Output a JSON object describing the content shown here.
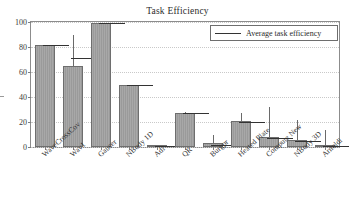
{
  "chart_data": {
    "type": "bar",
    "title": "Task Efficiency",
    "xlabel": "",
    "ylabel": "",
    "ylim": [
      0,
      100
    ],
    "yticks": [
      0,
      20,
      40,
      60,
      80,
      100
    ],
    "grid": true,
    "legend_position": "top-right",
    "legend": [
      "Average task efficiency"
    ],
    "categories": [
      "WaveCrossCov",
      "Wav1",
      "Gauser",
      "NBody 1D",
      "Adi",
      "QR",
      "Burgpr",
      "Heated Plate",
      "Compute New",
      "NBody 3D",
      "Arnoldi"
    ],
    "values": [
      82,
      65,
      99,
      50,
      1,
      27,
      3,
      21,
      8,
      6,
      1
    ],
    "whisker_max": [
      82,
      90,
      99,
      50,
      1,
      28,
      10,
      27,
      32,
      22,
      14
    ],
    "average_line": [
      82,
      71,
      99,
      50,
      1,
      27,
      2,
      20,
      7,
      5,
      1
    ],
    "series": [
      {
        "name": "Average task efficiency",
        "values": [
          82,
          71,
          99,
          50,
          1,
          27,
          2,
          20,
          7,
          5,
          1
        ]
      }
    ]
  },
  "figure": {
    "title": "Task Efficiency",
    "legend_label": "Average task efficiency"
  }
}
